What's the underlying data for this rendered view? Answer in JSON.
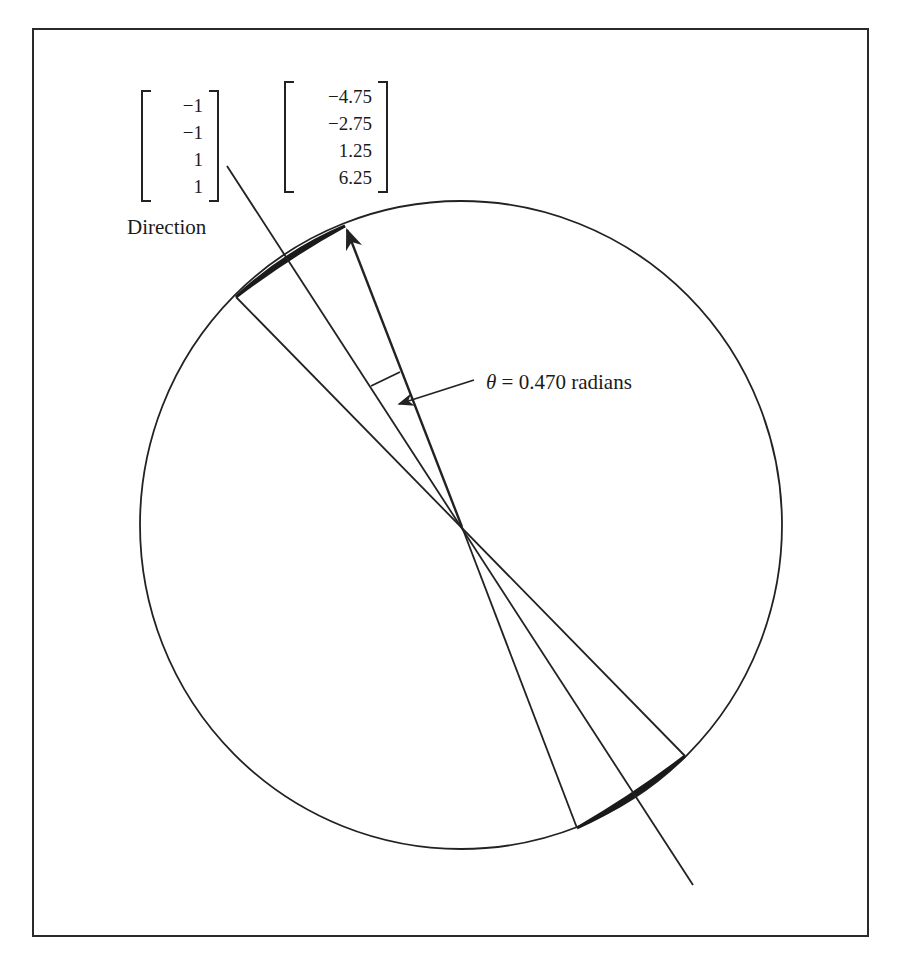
{
  "figure": {
    "direction_vector": {
      "values": [
        "−1",
        "−1",
        "1",
        "1"
      ],
      "caption": "Direction"
    },
    "point_vector": {
      "values": [
        "−4.75",
        "−2.75",
        "1.25",
        "6.25"
      ]
    },
    "angle_annotation": {
      "symbol": "θ",
      "equals": " = ",
      "value": "0.470",
      "unit": " radians"
    },
    "colors": {
      "line": "#222222",
      "background": "#ffffff",
      "cap_fill": "#1a1a1a"
    },
    "geometry": {
      "circle": {
        "cx": 461,
        "cy": 525,
        "rx": 321,
        "ry": 324
      },
      "center": {
        "x": 462,
        "y": 527
      },
      "direction_line": {
        "x1": 227,
        "y1": 166,
        "x2": 693,
        "y2": 885
      },
      "boundary_line_a": {
        "x1": 236,
        "y1": 297,
        "x2": 685,
        "y2": 756
      },
      "boundary_line_b": {
        "x1": 345,
        "y1": 226,
        "x2": 577,
        "y2": 828
      }
    }
  }
}
